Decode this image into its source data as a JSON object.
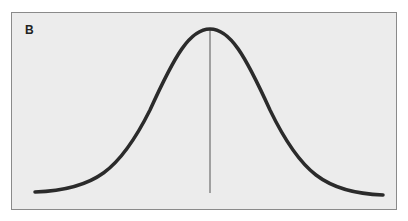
{
  "panel": {
    "label": "B",
    "curve_type": "normal-distribution",
    "curve_color": "#2b2b2b",
    "background_color": "#ececec",
    "mean_line": true
  }
}
